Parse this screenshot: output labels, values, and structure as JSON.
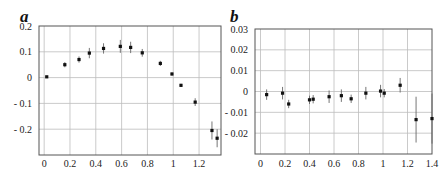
{
  "chart_data": [
    {
      "type": "scatter",
      "panel_label": "a",
      "title": "",
      "xlabel": "",
      "ylabel": "",
      "xlim": [
        -0.04,
        1.37
      ],
      "ylim": [
        -0.3,
        0.2
      ],
      "grid": true,
      "error_bars": true,
      "x_ticks": [
        0,
        0.2,
        0.4,
        0.6,
        0.8,
        1,
        1.2
      ],
      "x_tick_labels": [
        "0",
        "0.2",
        "0.4",
        "0.6",
        "0.8",
        "1",
        "1.2"
      ],
      "y_ticks": [
        0.2,
        0.1,
        0,
        -0.1,
        -0.2
      ],
      "y_tick_labels": [
        "0.2",
        "0.1",
        "0",
        "- 0.1",
        "- 0.2"
      ],
      "points": [
        {
          "x": 0.02,
          "y": 0.003,
          "err": 0.004
        },
        {
          "x": 0.16,
          "y": 0.05,
          "err": 0.01
        },
        {
          "x": 0.27,
          "y": 0.07,
          "err": 0.012
        },
        {
          "x": 0.35,
          "y": 0.095,
          "err": 0.02
        },
        {
          "x": 0.46,
          "y": 0.113,
          "err": 0.02
        },
        {
          "x": 0.59,
          "y": 0.121,
          "err": 0.025
        },
        {
          "x": 0.67,
          "y": 0.117,
          "err": 0.022
        },
        {
          "x": 0.76,
          "y": 0.096,
          "err": 0.015
        },
        {
          "x": 0.9,
          "y": 0.055,
          "err": 0.01
        },
        {
          "x": 0.99,
          "y": 0.014,
          "err": 0.006
        },
        {
          "x": 1.06,
          "y": -0.03,
          "err": 0.006
        },
        {
          "x": 1.17,
          "y": -0.095,
          "err": 0.015
        },
        {
          "x": 1.3,
          "y": -0.205,
          "err": 0.035
        },
        {
          "x": 1.34,
          "y": -0.235,
          "err": 0.035
        }
      ]
    },
    {
      "type": "scatter",
      "panel_label": "b",
      "title": "",
      "xlabel": "",
      "ylabel": "",
      "xlim": [
        -0.045,
        1.4
      ],
      "ylim": [
        -0.03,
        0.03
      ],
      "grid": true,
      "error_bars": true,
      "x_ticks": [
        0,
        0.2,
        0.4,
        0.6,
        0.8,
        1,
        1.2,
        1.4
      ],
      "x_tick_labels": [
        "0",
        "0.2",
        "0.4",
        "0.6",
        "0.8",
        "1",
        "1.2",
        "1.4"
      ],
      "y_ticks": [
        0.03,
        0.02,
        0.01,
        0,
        -0.01,
        -0.02
      ],
      "y_tick_labels": [
        "0.03",
        "0.02",
        "0.01",
        "0",
        "- 0.01",
        "- 0.02"
      ],
      "points": [
        {
          "x": 0.05,
          "y": -0.0015,
          "err": 0.0025
        },
        {
          "x": 0.18,
          "y": -0.0008,
          "err": 0.003
        },
        {
          "x": 0.23,
          "y": -0.006,
          "err": 0.002
        },
        {
          "x": 0.4,
          "y": -0.004,
          "err": 0.002
        },
        {
          "x": 0.43,
          "y": -0.0037,
          "err": 0.002
        },
        {
          "x": 0.56,
          "y": -0.0025,
          "err": 0.003
        },
        {
          "x": 0.66,
          "y": -0.002,
          "err": 0.003
        },
        {
          "x": 0.74,
          "y": -0.0035,
          "err": 0.002
        },
        {
          "x": 0.86,
          "y": -0.0008,
          "err": 0.003
        },
        {
          "x": 0.98,
          "y": 0.0002,
          "err": 0.003
        },
        {
          "x": 1.01,
          "y": -0.0008,
          "err": 0.002
        },
        {
          "x": 1.14,
          "y": 0.003,
          "err": 0.0035
        },
        {
          "x": 1.27,
          "y": -0.0135,
          "err": 0.011
        },
        {
          "x": 1.4,
          "y": -0.013,
          "err": 0.012
        }
      ]
    }
  ]
}
